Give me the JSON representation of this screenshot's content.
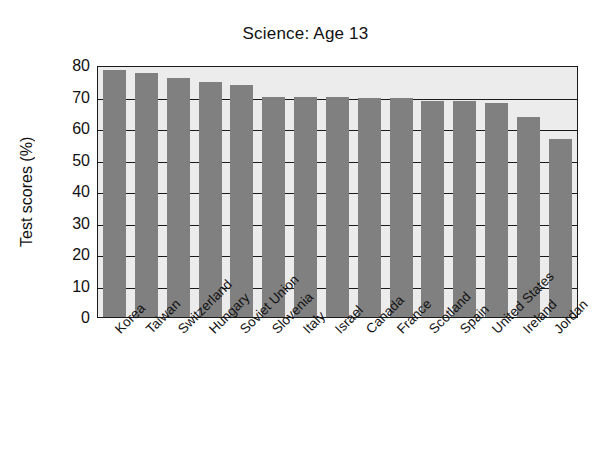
{
  "chart_data": {
    "type": "bar",
    "title": "Science: Age 13",
    "xlabel": "",
    "ylabel": "Test scores (%)",
    "ylim": [
      0,
      80
    ],
    "ytick_step": 10,
    "yticks": [
      80,
      70,
      60,
      50,
      40,
      30,
      20,
      10,
      0
    ],
    "grid": true,
    "legend": false,
    "bar_color": "#808080",
    "plot_background": "#ececec",
    "categories": [
      "Korea",
      "Taiwan",
      "Switzerland",
      "Hungary",
      "Soviet Union",
      "Slovenia",
      "Italy",
      "Israel",
      "Canada",
      "France",
      "Scotland",
      "Spain",
      "United States",
      "Ireland",
      "Jordan"
    ],
    "values": [
      78.5,
      77.5,
      76,
      74.5,
      73.5,
      70,
      70,
      70,
      69.5,
      69.5,
      68.5,
      68.5,
      68,
      63.5,
      56.5
    ]
  }
}
